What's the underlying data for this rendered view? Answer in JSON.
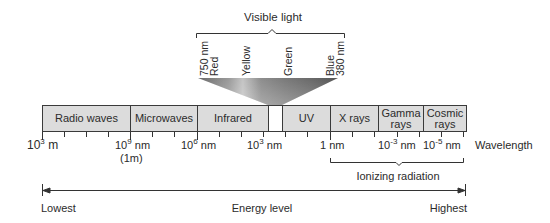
{
  "visible_light": {
    "title": "Visible light",
    "labels": [
      {
        "line1": "750 nm",
        "line2": "Red"
      },
      {
        "line1": "Yellow",
        "line2": ""
      },
      {
        "line1": "Green",
        "line2": ""
      },
      {
        "line1": "Blue",
        "line2": "380 nm"
      }
    ]
  },
  "bands": [
    {
      "label": "Radio waves"
    },
    {
      "label": "Microwaves"
    },
    {
      "label": "Infrared"
    },
    {
      "label": ""
    },
    {
      "label": "UV"
    },
    {
      "label": "X rays"
    },
    {
      "label": "Gamma rays"
    },
    {
      "label": "Cosmic rays"
    }
  ],
  "wavelength_axis": {
    "ticks": [
      {
        "base": "10",
        "exp": "3",
        "unit": " m",
        "sub": ""
      },
      {
        "base": "10",
        "exp": "9",
        "unit": " nm",
        "sub": "(1m)"
      },
      {
        "base": "10",
        "exp": "6",
        "unit": " nm",
        "sub": ""
      },
      {
        "base": "10",
        "exp": "3",
        "unit": " nm",
        "sub": ""
      },
      {
        "base": "1",
        "exp": "",
        "unit": " nm",
        "sub": ""
      },
      {
        "base": "10",
        "exp": "-3",
        "unit": " nm",
        "sub": ""
      },
      {
        "base": "10",
        "exp": "-5",
        "unit": " nm",
        "sub": ""
      }
    ],
    "label": "Wavelength"
  },
  "ionizing": {
    "label": "Ionizing radiation"
  },
  "energy": {
    "low": "Lowest",
    "title": "Energy level",
    "high": "Highest"
  }
}
